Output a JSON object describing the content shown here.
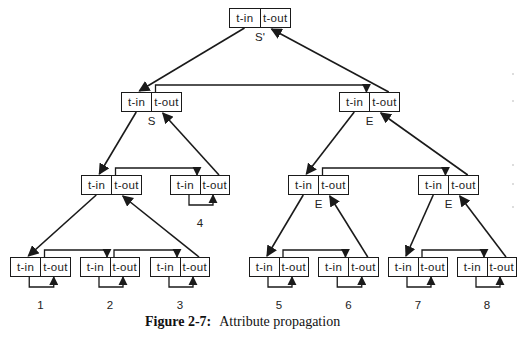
{
  "figure": {
    "number_label": "Figure 2-7:",
    "title": "Attribute propagation"
  },
  "cell_labels": {
    "in": "t-in",
    "out": "t-out"
  },
  "nodes": [
    {
      "id": "root",
      "symbol": "S'",
      "x": 229,
      "y": 8,
      "w": 62
    },
    {
      "id": "s",
      "symbol": "S",
      "x": 121,
      "y": 92,
      "w": 61
    },
    {
      "id": "e1",
      "symbol": "E",
      "x": 339,
      "y": 92,
      "w": 61
    },
    {
      "id": "s_l",
      "symbol": "",
      "x": 81,
      "y": 175,
      "w": 61
    },
    {
      "id": "leaf4",
      "symbol": "4",
      "x": 170,
      "y": 175,
      "w": 60
    },
    {
      "id": "e2",
      "symbol": "E",
      "x": 288,
      "y": 175,
      "w": 61
    },
    {
      "id": "e3",
      "symbol": "E",
      "x": 418,
      "y": 175,
      "w": 61
    },
    {
      "id": "leaf1",
      "symbol": "1",
      "x": 10,
      "y": 257,
      "w": 61
    },
    {
      "id": "leaf2",
      "symbol": "2",
      "x": 80,
      "y": 257,
      "w": 60
    },
    {
      "id": "leaf3",
      "symbol": "3",
      "x": 150,
      "y": 257,
      "w": 60
    },
    {
      "id": "leaf5",
      "symbol": "5",
      "x": 249,
      "y": 257,
      "w": 60
    },
    {
      "id": "leaf6",
      "symbol": "6",
      "x": 318,
      "y": 257,
      "w": 61
    },
    {
      "id": "leaf7",
      "symbol": "7",
      "x": 388,
      "y": 257,
      "w": 60
    },
    {
      "id": "leaf8",
      "symbol": "8",
      "x": 457,
      "y": 257,
      "w": 60
    }
  ],
  "leaf_ids": [
    "leaf1",
    "leaf2",
    "leaf3",
    "leaf4",
    "leaf5",
    "leaf6",
    "leaf7",
    "leaf8"
  ],
  "edges_down": [
    [
      "root",
      "s"
    ],
    [
      "s",
      "s_l"
    ],
    [
      "s_l",
      "leaf1"
    ],
    [
      "e1",
      "e2"
    ],
    [
      "e2",
      "leaf5"
    ],
    [
      "e3",
      "leaf7"
    ]
  ],
  "edges_up": [
    [
      "e1",
      "root"
    ],
    [
      "leaf4",
      "s"
    ],
    [
      "leaf3",
      "s_l"
    ],
    [
      "e3",
      "e1"
    ],
    [
      "leaf6",
      "e2"
    ],
    [
      "leaf8",
      "e3"
    ]
  ],
  "edges_sibling": [
    [
      "s",
      "e1"
    ],
    [
      "s_l",
      "leaf4"
    ],
    [
      "leaf1",
      "leaf2"
    ],
    [
      "leaf2",
      "leaf3"
    ],
    [
      "e2",
      "e3"
    ],
    [
      "leaf5",
      "leaf6"
    ],
    [
      "leaf7",
      "leaf8"
    ]
  ],
  "colors": {
    "ink": "#1a1a1a",
    "background": "#ffffff"
  }
}
